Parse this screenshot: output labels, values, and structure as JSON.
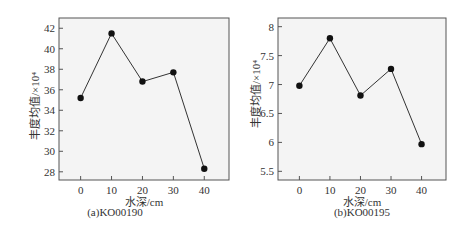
{
  "chart_data": [
    {
      "type": "line",
      "title": "(a)KO00190",
      "xlabel": "水深/cm",
      "ylabel": "丰度均值/×10⁴",
      "x": [
        0,
        10,
        20,
        30,
        40
      ],
      "series": [
        {
          "name": "KO00190",
          "values": [
            35.2,
            41.5,
            36.8,
            37.7,
            28.3
          ]
        }
      ],
      "xticks": [
        0,
        10,
        20,
        30,
        40
      ],
      "yticks": [
        28,
        30,
        32,
        34,
        36,
        38,
        40,
        42
      ],
      "xlim": [
        -7,
        48
      ],
      "ylim": [
        27.2,
        43
      ],
      "grid": false,
      "legend": "none"
    },
    {
      "type": "line",
      "title": "(b)KO00195",
      "xlabel": "水深/cm",
      "ylabel": "丰度均值/×10⁴",
      "x": [
        0,
        10,
        20,
        30,
        40
      ],
      "series": [
        {
          "name": "KO00195",
          "values": [
            6.98,
            7.8,
            6.81,
            7.27,
            5.97
          ]
        }
      ],
      "xticks": [
        0,
        10,
        20,
        30,
        40
      ],
      "yticks": [
        5.5,
        6,
        6.5,
        7,
        7.5,
        8
      ],
      "ytick_labels": [
        "5.5",
        "6",
        "6.5",
        "7",
        "7.5",
        "8"
      ],
      "xlim": [
        -7,
        48
      ],
      "ylim": [
        5.35,
        8.15
      ],
      "grid": false,
      "legend": "none"
    }
  ],
  "charts": [
    {
      "caption": "(a)KO00190",
      "xlabel": "水深/cm",
      "ylabel": "丰度均值/×10⁴"
    },
    {
      "caption": "(b)KO00195",
      "xlabel": "水深/cm",
      "ylabel": "丰度均值/×10⁴"
    }
  ],
  "colors": {
    "frame": "#555555",
    "line": "#333333",
    "marker": "#111111",
    "plot_bg": "#f4f4f4"
  }
}
